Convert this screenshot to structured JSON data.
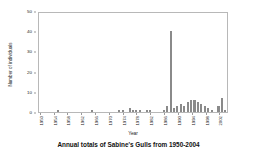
{
  "caption": "Annual totals of Sabine's Gulls from 1950-2004",
  "colors": {
    "bar": "#8a8a8a",
    "axis": "#b8b8b8",
    "text": "#1a1a1a",
    "background": "#ffffff"
  },
  "chart_data": {
    "type": "bar",
    "title": "Annual totals of Sabine's Gulls from 1950-2004",
    "xlabel": "Year",
    "ylabel": "Number of individuals",
    "ylim": [
      0,
      50
    ],
    "yticks": [
      0,
      10,
      20,
      30,
      40,
      50
    ],
    "xticks": [
      1950,
      1954,
      1958,
      1962,
      1966,
      1970,
      1974,
      1978,
      1982,
      1986,
      1990,
      1994,
      1998,
      2002
    ],
    "grid": false,
    "legend": null,
    "categories": [
      1950,
      1951,
      1952,
      1953,
      1954,
      1955,
      1956,
      1957,
      1958,
      1959,
      1960,
      1961,
      1962,
      1963,
      1964,
      1965,
      1966,
      1967,
      1968,
      1969,
      1970,
      1971,
      1972,
      1973,
      1974,
      1975,
      1976,
      1977,
      1978,
      1979,
      1980,
      1981,
      1982,
      1983,
      1984,
      1985,
      1986,
      1987,
      1988,
      1989,
      1990,
      1991,
      1992,
      1993,
      1994,
      1995,
      1996,
      1997,
      1998,
      1999,
      2000,
      2001,
      2002,
      2003,
      2004
    ],
    "values": [
      0,
      0,
      0,
      0,
      0,
      1,
      0,
      0,
      0,
      0,
      0,
      0,
      0,
      0,
      0,
      1,
      0,
      0,
      0,
      0,
      0,
      0,
      0,
      1,
      1,
      0,
      2,
      1,
      1,
      1,
      0,
      1,
      1,
      0,
      0,
      0,
      1,
      3,
      41,
      2,
      3,
      4,
      3,
      5,
      6,
      6,
      5,
      4,
      3,
      2,
      1,
      0,
      3,
      7,
      1
    ]
  }
}
